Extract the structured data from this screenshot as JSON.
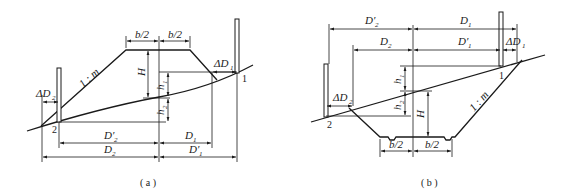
{
  "figure_a": {
    "caption": "( a )",
    "labels": {
      "b_half_left": "b/2",
      "b_half_right": "b/2",
      "slope": "1 : m",
      "height": "H",
      "h1": "h",
      "h1_sub": "1",
      "h2": "h",
      "h2_sub": "2",
      "delta_d1": "ΔD",
      "delta_d1_sub": "1",
      "delta_d2": "ΔD",
      "delta_d2_sub": "2",
      "d1": "D",
      "d1_sub": "1",
      "d1_prime": "D′",
      "d1_prime_sub": "1",
      "d2": "D",
      "d2_sub": "2",
      "d2_prime": "D′",
      "d2_prime_sub": "2",
      "point_1": "1",
      "point_2": "2"
    }
  },
  "figure_b": {
    "caption": "( b )",
    "labels": {
      "b_half_left": "b/2",
      "b_half_right": "b/2",
      "slope": "1 : m",
      "height": "H",
      "h1": "h",
      "h1_sub": "1",
      "h2": "h",
      "h2_sub": "2",
      "delta_d1": "ΔD",
      "delta_d1_sub": "1",
      "delta_d2": "ΔD",
      "delta_d2_sub": "2",
      "d1": "D",
      "d1_sub": "1",
      "d1_prime": "D′",
      "d1_prime_sub": "1",
      "d2": "D",
      "d2_sub": "2",
      "d2_prime": "D′",
      "d2_prime_sub": "2",
      "point_1": "1",
      "point_2": "2"
    }
  }
}
